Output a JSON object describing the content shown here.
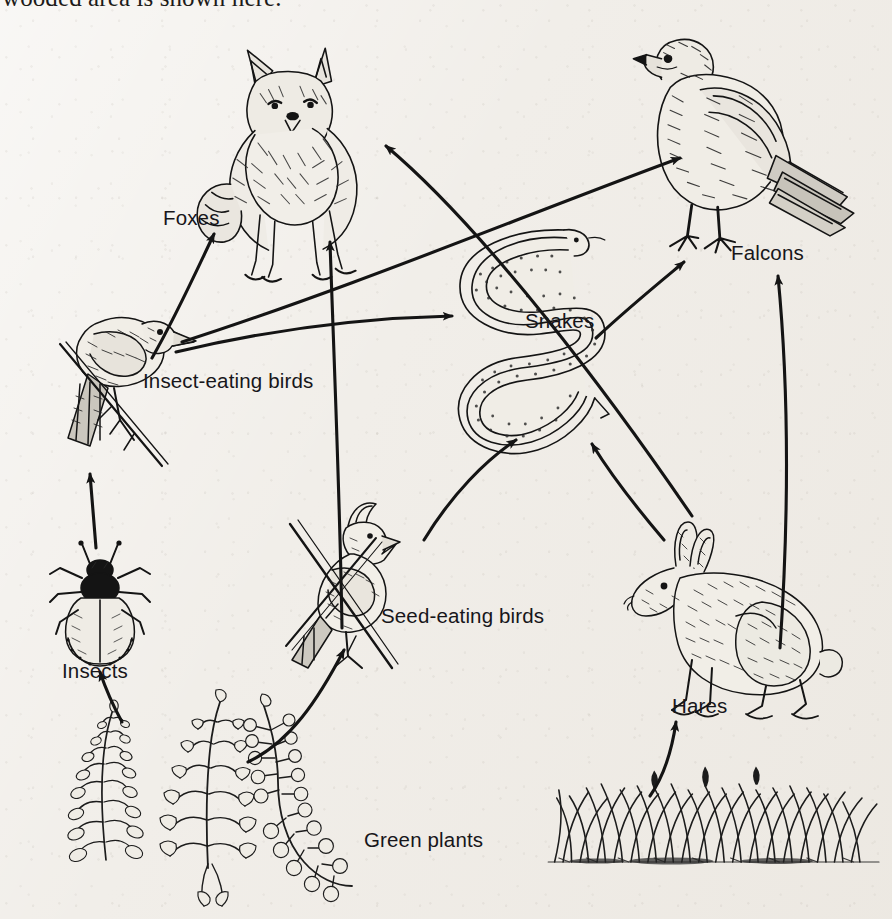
{
  "page": {
    "caption": "wooded area is shown here.",
    "background_color": "#f1eee9",
    "ink_color": "#141414",
    "width": 892,
    "height": 919
  },
  "diagram": {
    "type": "food-web",
    "habitat": "wooded area",
    "nodes": [
      {
        "id": "foxes",
        "label": "Foxes",
        "trophic_level": "tertiary consumer",
        "label_x": 163,
        "label_y": 206,
        "art_x": 195,
        "art_y": 40,
        "art_w": 200,
        "art_h": 195
      },
      {
        "id": "falcons",
        "label": "Falcons",
        "trophic_level": "tertiary consumer",
        "label_x": 731,
        "label_y": 241,
        "art_x": 610,
        "art_y": 35,
        "art_w": 260,
        "art_h": 215
      },
      {
        "id": "snakes",
        "label": "Snakes",
        "trophic_level": "secondary consumer",
        "label_x": 525,
        "label_y": 309,
        "art_x": 455,
        "art_y": 228,
        "art_w": 165,
        "art_h": 215
      },
      {
        "id": "insect_birds",
        "label": "Insect-eating birds",
        "trophic_level": "secondary consumer",
        "label_x": 143,
        "label_y": 369,
        "art_x": 40,
        "art_y": 288,
        "art_w": 160,
        "art_h": 185
      },
      {
        "id": "seed_birds",
        "label": "Seed-eating birds",
        "trophic_level": "primary consumer",
        "label_x": 381,
        "label_y": 604,
        "art_x": 282,
        "art_y": 495,
        "art_w": 140,
        "art_h": 155
      },
      {
        "id": "insects",
        "label": "Insects",
        "trophic_level": "primary consumer",
        "label_x": 62,
        "label_y": 659,
        "art_x": 48,
        "art_y": 540,
        "art_w": 110,
        "art_h": 115
      },
      {
        "id": "hares",
        "label": "Hares",
        "trophic_level": "primary consumer",
        "label_x": 672,
        "label_y": 694,
        "art_x": 615,
        "art_y": 520,
        "art_w": 215,
        "art_h": 170
      },
      {
        "id": "green_plants",
        "label": "Green plants",
        "trophic_level": "producer",
        "label_x": 364,
        "label_y": 828,
        "art_x": 58,
        "art_y": 690,
        "art_w": 290,
        "art_h": 175
      },
      {
        "id": "grass",
        "label": "",
        "trophic_level": "producer",
        "label_x": 0,
        "label_y": 0,
        "art_x": 540,
        "art_y": 762,
        "art_w": 340,
        "art_h": 100
      }
    ],
    "links": [
      {
        "from": "green_plants",
        "to": "insects",
        "name": "green-plants-to-insects"
      },
      {
        "from": "green_plants",
        "to": "seed_birds",
        "name": "green-plants-to-seed-eating-birds"
      },
      {
        "from": "grass",
        "to": "hares",
        "name": "grass-to-hares"
      },
      {
        "from": "insects",
        "to": "insect_birds",
        "name": "insects-to-insect-eating-birds"
      },
      {
        "from": "insect_birds",
        "to": "foxes",
        "name": "insect-eating-birds-to-foxes"
      },
      {
        "from": "insect_birds",
        "to": "snakes",
        "name": "insect-eating-birds-to-snakes"
      },
      {
        "from": "insect_birds",
        "to": "falcons",
        "name": "insect-eating-birds-to-falcons"
      },
      {
        "from": "seed_birds",
        "to": "foxes",
        "name": "seed-eating-birds-to-foxes"
      },
      {
        "from": "seed_birds",
        "to": "snakes",
        "name": "seed-eating-birds-to-snakes"
      },
      {
        "from": "hares",
        "to": "foxes",
        "name": "hares-to-foxes"
      },
      {
        "from": "hares",
        "to": "snakes",
        "name": "hares-to-snakes"
      },
      {
        "from": "hares",
        "to": "falcons",
        "name": "hares-to-falcons"
      },
      {
        "from": "snakes",
        "to": "falcons",
        "name": "snakes-to-falcons"
      }
    ]
  }
}
